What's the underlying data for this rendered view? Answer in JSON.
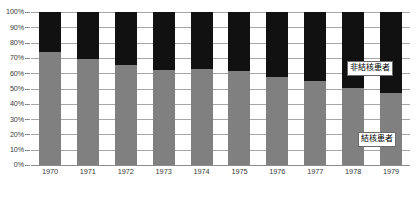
{
  "chart_data": {
    "type": "bar",
    "stacked": true,
    "normalized_percent": true,
    "title": "",
    "subtitle": "",
    "xlabel": "",
    "ylabel": "",
    "categories": [
      "1970",
      "1971",
      "1972",
      "1973",
      "1974",
      "1975",
      "1976",
      "1977",
      "1978",
      "1979"
    ],
    "series": [
      {
        "name": "結核患者",
        "color": "#808080",
        "values": [
          74,
          69.5,
          65.5,
          62,
          63,
          61.5,
          57.5,
          55,
          50.5,
          47
        ]
      },
      {
        "name": "非結核患者",
        "color": "#111111",
        "values": [
          26,
          30.5,
          34.5,
          38,
          37,
          38.5,
          42.5,
          45,
          49.5,
          53
        ]
      }
    ],
    "ylim": [
      0,
      100
    ],
    "yticks": [
      0,
      10,
      20,
      30,
      40,
      50,
      60,
      70,
      80,
      90,
      100
    ],
    "ytick_labels": [
      "0%",
      "10%",
      "20%",
      "30%",
      "40%",
      "50%",
      "60%",
      "70%",
      "80%",
      "90%",
      "100%"
    ],
    "grid": true,
    "grid_axis": "y",
    "legend_position": "inside-right",
    "annotations": [
      {
        "name": "非結核患者",
        "text": "非結核患者"
      },
      {
        "name": "結核患者",
        "text": "結核患者"
      }
    ]
  },
  "legend": {
    "non_tb_label": "非結核患者",
    "tb_label": "結核患者"
  },
  "colors": {
    "lower_segment": "#808080",
    "upper_segment": "#111111",
    "gridline": "#a6a6a6",
    "axis": "#8c8c8c",
    "text": "#3a3a3a",
    "background": "#ffffff"
  }
}
